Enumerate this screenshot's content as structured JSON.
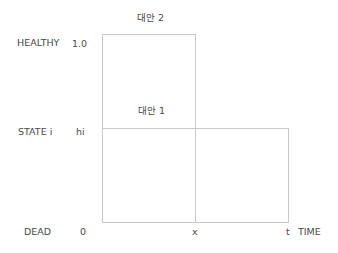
{
  "diagram": {
    "y_axis": {
      "state_labels": {
        "healthy": "HEALTHY",
        "state_i": "STATE i",
        "dead": "DEAD"
      },
      "value_labels": {
        "healthy": "1.0",
        "state_i": "hi",
        "dead": "0"
      }
    },
    "x_axis": {
      "tick_x": "x",
      "tick_t": "t",
      "label": "TIME"
    },
    "alternatives": {
      "alt2": {
        "label": "대안 2",
        "height_value": "1.0",
        "duration": "x"
      },
      "alt1": {
        "label": "대안 1",
        "height_value": "hi",
        "duration": "t"
      }
    },
    "line_color": "#c9c9c9"
  }
}
